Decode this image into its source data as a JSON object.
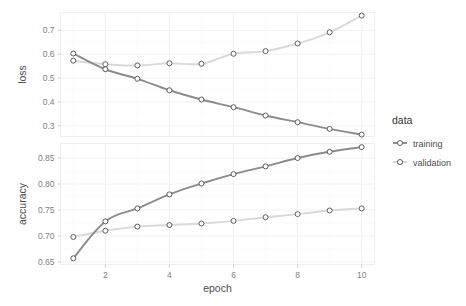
{
  "chart_data": {
    "type": "line",
    "title": "",
    "subtitle": "",
    "xlabel": "epoch",
    "x": [
      1,
      2,
      3,
      4,
      5,
      6,
      7,
      8,
      9,
      10
    ],
    "xlim": [
      0.6,
      10.4
    ],
    "xticks": [
      "2",
      "4",
      "6",
      "8",
      "10"
    ],
    "xtick_values": [
      2,
      4,
      6,
      8,
      10
    ],
    "grid": true,
    "legend": {
      "title": "data",
      "position": "right",
      "entries": [
        {
          "name": "training",
          "color": "#8c8c8c"
        },
        {
          "name": "validation",
          "color": "#d9d9d9"
        }
      ]
    },
    "facets": [
      {
        "ylabel": "loss",
        "ylim": [
          0.255,
          0.775
        ],
        "yticks": [
          "0.3",
          "0.4",
          "0.5",
          "0.6",
          "0.7"
        ],
        "ytick_values": [
          0.3,
          0.4,
          0.5,
          0.6,
          0.7
        ],
        "series": [
          {
            "name": "training",
            "color": "#8c8c8c",
            "values": [
              0.603,
              0.537,
              0.497,
              0.449,
              0.41,
              0.378,
              0.343,
              0.315,
              0.287,
              0.263
            ]
          },
          {
            "name": "validation",
            "color": "#d9d9d9",
            "values": [
              0.573,
              0.558,
              0.553,
              0.562,
              0.56,
              0.602,
              0.613,
              0.645,
              0.692,
              0.762
            ]
          }
        ]
      },
      {
        "ylabel": "accuracy",
        "ylim": [
          0.645,
          0.878
        ],
        "yticks": [
          "0.65",
          "0.70",
          "0.75",
          "0.80",
          "0.85"
        ],
        "ytick_values": [
          0.65,
          0.7,
          0.75,
          0.8,
          0.85
        ],
        "series": [
          {
            "name": "training",
            "color": "#8c8c8c",
            "values": [
              0.657,
              0.728,
              0.753,
              0.78,
              0.801,
              0.819,
              0.834,
              0.85,
              0.862,
              0.871
            ]
          },
          {
            "name": "validation",
            "color": "#d9d9d9",
            "values": [
              0.698,
              0.71,
              0.718,
              0.721,
              0.724,
              0.729,
              0.736,
              0.742,
              0.749,
              0.753
            ]
          }
        ]
      }
    ]
  },
  "style": {
    "panel_bg": "#ffffff",
    "grid_color": "#f2f2f2",
    "panel_border": "#ebebeb",
    "point_stroke": "#4d4d4d"
  }
}
